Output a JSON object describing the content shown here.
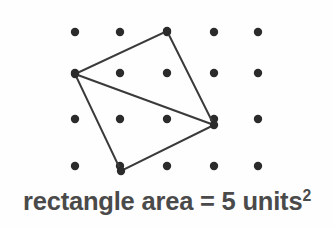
{
  "figure": {
    "background_color": "#fefefe"
  },
  "caption": {
    "prefix": "rectangle area = 5 units",
    "exponent": "2",
    "full_text": "rectangle area = 5 units²",
    "color": "#4a4a4a"
  },
  "chart_data": {
    "type": "scatter",
    "xlabel": "",
    "ylabel": "",
    "grid": false,
    "legend": null,
    "dot_color": "#2b2b2b",
    "line_color": "#3a3a3a",
    "dot_radius": 4.2,
    "line_width": 2.0,
    "grid_columns": 5,
    "grid_rows": 4,
    "grid_x": [
      75,
      120,
      167,
      214,
      258
    ],
    "grid_y": [
      32,
      73,
      119,
      166
    ],
    "points": [
      {
        "x": 75,
        "y": 32
      },
      {
        "x": 120,
        "y": 32
      },
      {
        "x": 167,
        "y": 32
      },
      {
        "x": 214,
        "y": 32
      },
      {
        "x": 258,
        "y": 32
      },
      {
        "x": 75,
        "y": 73
      },
      {
        "x": 120,
        "y": 73
      },
      {
        "x": 167,
        "y": 73
      },
      {
        "x": 214,
        "y": 73
      },
      {
        "x": 258,
        "y": 73
      },
      {
        "x": 75,
        "y": 119
      },
      {
        "x": 120,
        "y": 119
      },
      {
        "x": 167,
        "y": 119
      },
      {
        "x": 214,
        "y": 119
      },
      {
        "x": 258,
        "y": 119
      },
      {
        "x": 75,
        "y": 166
      },
      {
        "x": 120,
        "y": 166
      },
      {
        "x": 167,
        "y": 166
      },
      {
        "x": 214,
        "y": 166
      },
      {
        "x": 258,
        "y": 166
      }
    ],
    "shapes": [
      {
        "name": "quadrilateral",
        "closed": true,
        "vertices": [
          {
            "x": 167,
            "y": 31
          },
          {
            "x": 214,
            "y": 125
          },
          {
            "x": 121,
            "y": 171
          },
          {
            "x": 75,
            "y": 74
          }
        ]
      },
      {
        "name": "diagonal",
        "closed": false,
        "vertices": [
          {
            "x": 75,
            "y": 74
          },
          {
            "x": 214,
            "y": 125
          }
        ]
      }
    ],
    "vertex_markers": [
      {
        "x": 167,
        "y": 31
      },
      {
        "x": 214,
        "y": 125
      },
      {
        "x": 121,
        "y": 171
      },
      {
        "x": 75,
        "y": 74
      }
    ],
    "area_value": 5,
    "area_units": "units²"
  }
}
